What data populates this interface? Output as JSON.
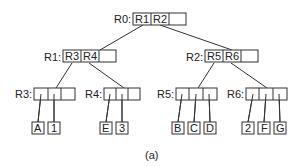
{
  "diagram": {
    "caption": "(a)",
    "nodes": [
      {
        "id": "R0",
        "label": "R0:",
        "entries": [
          "R1",
          "R2",
          ""
        ],
        "x": 133,
        "y": 13,
        "w": 53
      },
      {
        "id": "R1",
        "label": "R1:",
        "entries": [
          "R3",
          "R4",
          ""
        ],
        "x": 63,
        "y": 50,
        "w": 53
      },
      {
        "id": "R2",
        "label": "R2:",
        "entries": [
          "R5",
          "R6",
          ""
        ],
        "x": 205,
        "y": 50,
        "w": 53
      },
      {
        "id": "R3",
        "label": "R3:",
        "entries": [
          "",
          "",
          ""
        ],
        "x": 34,
        "y": 88,
        "w": 41
      },
      {
        "id": "R4",
        "label": "R4:",
        "entries": [
          "",
          "",
          ""
        ],
        "x": 104,
        "y": 88,
        "w": 36
      },
      {
        "id": "R5",
        "label": "R5:",
        "entries": [
          "",
          "",
          ""
        ],
        "x": 176,
        "y": 88,
        "w": 41
      },
      {
        "id": "R6",
        "label": "R6:",
        "entries": [
          "",
          "",
          ""
        ],
        "x": 246,
        "y": 88,
        "w": 41
      }
    ],
    "leaves": [
      {
        "label": "A",
        "x": 32
      },
      {
        "label": "1",
        "x": 48
      },
      {
        "label": "E",
        "x": 100
      },
      {
        "label": "3",
        "x": 116
      },
      {
        "label": "B",
        "x": 172
      },
      {
        "label": "C",
        "x": 188
      },
      {
        "label": "D",
        "x": 204
      },
      {
        "label": "2",
        "x": 242
      },
      {
        "label": "F",
        "x": 258
      },
      {
        "label": "G",
        "x": 274
      }
    ]
  }
}
